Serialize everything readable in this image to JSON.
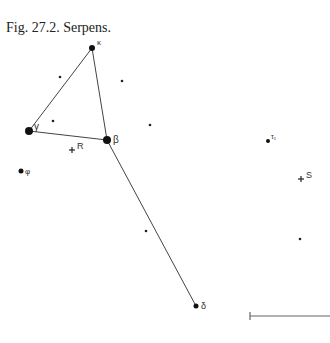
{
  "figure": {
    "caption": "Fig. 27.2. Serpens.",
    "stars": [
      {
        "id": "kappa",
        "label": "κ",
        "x": 92,
        "y": 48,
        "r": 3
      },
      {
        "id": "gamma",
        "label": "γ",
        "x": 29,
        "y": 131,
        "r": 4
      },
      {
        "id": "beta",
        "label": "β",
        "x": 107,
        "y": 140,
        "r": 4
      },
      {
        "id": "phi",
        "label": "φ",
        "x": 21,
        "y": 171,
        "r": 2.5
      },
      {
        "id": "tau1",
        "label": "τ₁",
        "x": 268,
        "y": 141,
        "r": 2
      },
      {
        "id": "delta",
        "label": "δ",
        "x": 196,
        "y": 306,
        "r": 2.5
      }
    ],
    "minor_stars": [
      {
        "x": 60,
        "y": 77
      },
      {
        "x": 122,
        "y": 81
      },
      {
        "x": 53,
        "y": 121
      },
      {
        "x": 150,
        "y": 125
      },
      {
        "x": 146,
        "y": 231
      },
      {
        "x": 300,
        "y": 239
      }
    ],
    "variables": [
      {
        "id": "R",
        "label": "R",
        "x": 72,
        "y": 150
      },
      {
        "id": "S",
        "label": "S",
        "x": 301,
        "y": 179
      }
    ],
    "lines": [
      {
        "from": "gamma",
        "to": "kappa"
      },
      {
        "from": "kappa",
        "to": "beta"
      },
      {
        "from": "gamma",
        "to": "beta"
      },
      {
        "from": "beta",
        "to": "delta"
      }
    ],
    "scale_bar": {
      "x1": 250,
      "x2": 330,
      "y": 316
    }
  }
}
